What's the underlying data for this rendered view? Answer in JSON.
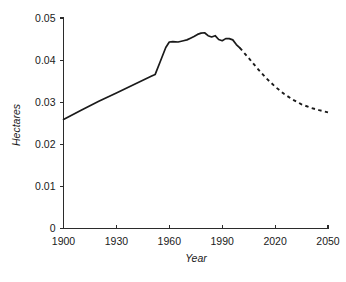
{
  "chart_data": {
    "type": "line",
    "title": "",
    "subtitle": "",
    "xlabel": "Year",
    "ylabel": "Hectares",
    "xlim": [
      1900,
      2050
    ],
    "ylim": [
      0,
      0.05
    ],
    "grid": false,
    "legend": null,
    "xticks": [
      "1900",
      "1930",
      "1960",
      "1990",
      "2020",
      "2050"
    ],
    "xtick_values": [
      1900,
      1930,
      1960,
      1990,
      2020,
      2050
    ],
    "yticks": [
      "0",
      "0.01",
      "0.02",
      "0.03",
      "0.04",
      "0.05"
    ],
    "ytick_values": [
      0,
      0.01,
      0.02,
      0.03,
      0.04,
      0.05
    ],
    "series": [
      {
        "name": "Historical (solid)",
        "style": "solid",
        "x": [
          1900,
          1910,
          1920,
          1930,
          1940,
          1950,
          1952,
          1955,
          1958,
          1960,
          1962,
          1965,
          1968,
          1970,
          1972,
          1974,
          1976,
          1978,
          1980,
          1982,
          1984,
          1986,
          1988,
          1990,
          1992,
          1994,
          1996,
          1998,
          2000
        ],
        "values": [
          0.0259,
          0.0281,
          0.0302,
          0.0322,
          0.0342,
          0.0362,
          0.0366,
          0.0398,
          0.043,
          0.0443,
          0.0444,
          0.0443,
          0.0446,
          0.0448,
          0.0452,
          0.0456,
          0.0461,
          0.0464,
          0.0465,
          0.0458,
          0.0455,
          0.0458,
          0.0449,
          0.0446,
          0.0451,
          0.0451,
          0.0448,
          0.0437,
          0.0429
        ]
      },
      {
        "name": "Projection (dashed)",
        "style": "dashed",
        "x": [
          2000,
          2005,
          2010,
          2015,
          2020,
          2025,
          2030,
          2035,
          2040,
          2045,
          2050
        ],
        "values": [
          0.0429,
          0.0405,
          0.038,
          0.0357,
          0.0337,
          0.032,
          0.0306,
          0.0295,
          0.0287,
          0.0281,
          0.0276
        ]
      }
    ]
  },
  "axes": {
    "y_title": "Hectares",
    "x_title": "Year"
  }
}
